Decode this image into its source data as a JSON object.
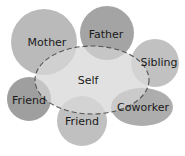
{
  "diagram": {
    "type": "relationship-map",
    "center": {
      "label": "Self",
      "fill": "#dedede",
      "stroke": "#555555",
      "dashed": true
    },
    "nodes": [
      {
        "id": "mother",
        "label": "Mother",
        "fill": "#b4b4b4"
      },
      {
        "id": "father",
        "label": "Father",
        "fill": "#9c9c9c"
      },
      {
        "id": "sibling",
        "label": "Sibling",
        "fill": "#bcbcbc"
      },
      {
        "id": "friend1",
        "label": "Friend",
        "fill": "#9a9a9a"
      },
      {
        "id": "friend2",
        "label": "Friend",
        "fill": "#bdbdbd"
      },
      {
        "id": "coworker",
        "label": "Coworker",
        "fill": "#a9a9a9"
      }
    ]
  }
}
